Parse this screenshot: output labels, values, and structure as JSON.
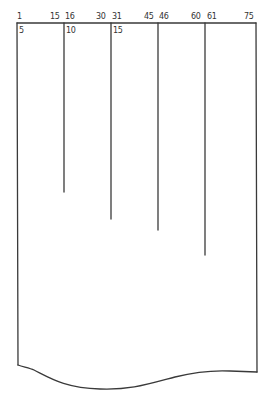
{
  "diagram": {
    "type": "card-column-layout",
    "stroke_color": "#3a3a3a",
    "column_ranges": [
      {
        "start": "1",
        "end": "15",
        "width_label": "5",
        "x_left": 17,
        "x_right": 64,
        "divider_end_y": 192
      },
      {
        "start": "16",
        "end": "30",
        "width_label": "10",
        "x_left": 64,
        "x_right": 111,
        "divider_end_y": 219
      },
      {
        "start": "31",
        "end": "45",
        "width_label": "15",
        "x_left": 111,
        "x_right": 158,
        "divider_end_y": 230
      },
      {
        "start": "46",
        "end": "60",
        "width_label": "",
        "x_left": 158,
        "x_right": 205,
        "divider_end_y": 255
      },
      {
        "start": "61",
        "end": "75",
        "width_label": "",
        "x_left": 205,
        "x_right": 256,
        "divider_end_y": null
      }
    ],
    "top_labels": [
      "1",
      "15",
      "16",
      "30",
      "31",
      "45",
      "46",
      "60",
      "61",
      "75"
    ],
    "sub_labels": [
      "5",
      "10",
      "15"
    ]
  }
}
